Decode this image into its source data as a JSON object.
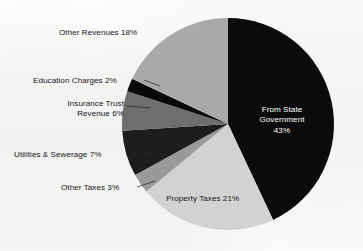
{
  "chart_data": {
    "type": "pie",
    "title": "",
    "subtitle": "",
    "xlabel": "",
    "ylabel": "",
    "legend_position": "none",
    "grid": false,
    "unit": "%",
    "total": 100,
    "start_angle_deg": 0,
    "direction": "clockwise",
    "categories": [
      "From State Government",
      "Property Taxes",
      "Other Taxes",
      "Utilities & Sewerage",
      "Insurance Trust Revenue",
      "Education Charges",
      "Other Revenues"
    ],
    "values": [
      43,
      21,
      3,
      7,
      6,
      2,
      18
    ],
    "colors": [
      "#0b0b0b",
      "#d2d2d2",
      "#9a9a9a",
      "#1d1d1d",
      "#6e6e6e",
      "#090909",
      "#a9a9a9"
    ],
    "slices": [
      {
        "name": "From State Government",
        "value": 43,
        "value_text": "43%",
        "label_line1": "From State",
        "label_line2": "Government",
        "label_line3": "43%",
        "color": "#0b0b0b",
        "label_placement": "inside",
        "label_color": "#ffffff"
      },
      {
        "name": "Property Taxes",
        "value": 21,
        "value_text": "21%",
        "label": "Property Taxes 21%",
        "color": "#d2d2d2",
        "label_placement": "inside",
        "label_color": "#17171b"
      },
      {
        "name": "Other Taxes",
        "value": 3,
        "value_text": "3%",
        "label": "Other Taxes 3%",
        "color": "#9a9a9a",
        "label_placement": "outside-left",
        "label_color": "#16161a"
      },
      {
        "name": "Utilities & Sewerage",
        "value": 7,
        "value_text": "7%",
        "label": "Utilities & Sewerage 7%",
        "color": "#1d1d1d",
        "label_placement": "outside-left",
        "label_color": "#16161a"
      },
      {
        "name": "Insurance Trust Revenue",
        "value": 6,
        "value_text": "6%",
        "label_line1": "Insurance Trust",
        "label_line2": "Revenue 6%",
        "color": "#6e6e6e",
        "label_placement": "outside-left",
        "label_color": "#16161a"
      },
      {
        "name": "Education Charges",
        "value": 2,
        "value_text": "2%",
        "label": "Education Charges 2%",
        "color": "#090909",
        "label_placement": "outside-left",
        "label_color": "#16161a"
      },
      {
        "name": "Other Revenues",
        "value": 18,
        "value_text": "18%",
        "label": "Other Revenues 18%",
        "color": "#a9a9a9",
        "label_placement": "outside-left",
        "label_color": "#16161a"
      }
    ]
  },
  "labels": {
    "other_revenues": "Other Revenues 18%",
    "education_charges": "Education Charges 2%",
    "insurance_trust_line1": "Insurance Trust",
    "insurance_trust_line2": "Revenue 6%",
    "utilities_sewerage": "Utilities & Sewerage 7%",
    "other_taxes": "Other Taxes 3%",
    "property_taxes": "Property Taxes 21%",
    "from_state_line1": "From State",
    "from_state_line2": "Government",
    "from_state_line3": "43%"
  }
}
